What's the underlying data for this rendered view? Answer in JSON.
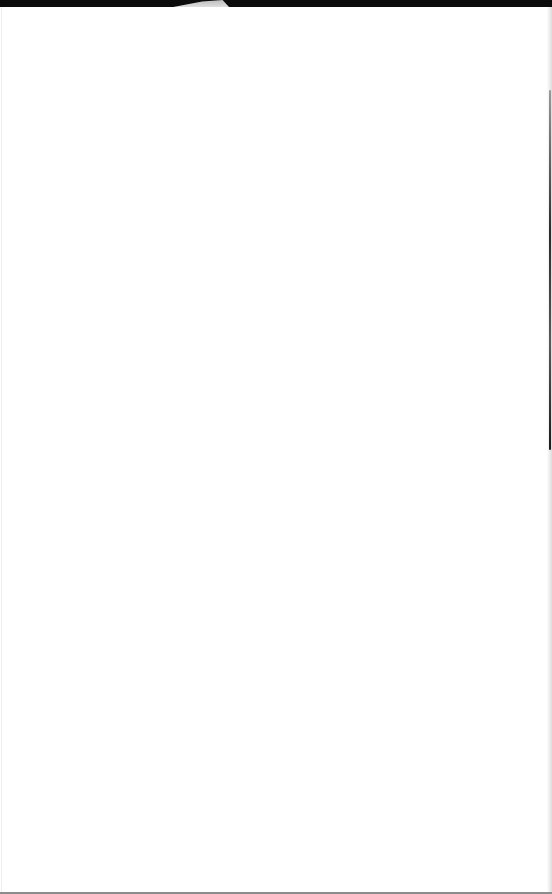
{
  "window": {
    "state": "blank-page",
    "colors": {
      "top_bar": "#0b0b0b",
      "tab": "#d0d0d0",
      "background": "#ffffff",
      "scrollbar_thumb": "#2a2a2a",
      "bottom_border": "#8c8c8c"
    }
  },
  "content": {
    "text": ""
  }
}
